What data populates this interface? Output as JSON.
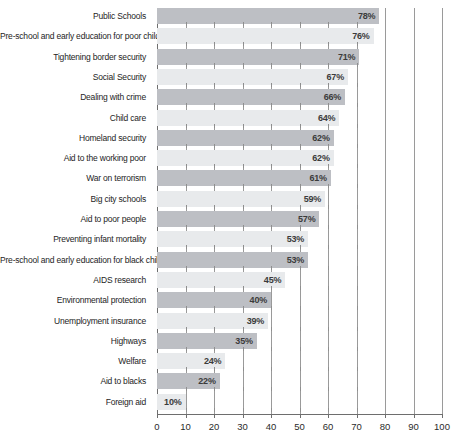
{
  "chart_data": {
    "type": "bar",
    "orientation": "horizontal",
    "title": "",
    "xlabel": "",
    "ylabel": "",
    "xlim": [
      0,
      100
    ],
    "xticks": [
      0,
      10,
      20,
      30,
      40,
      50,
      60,
      70,
      80,
      90,
      100
    ],
    "xtick_labels": [
      "0",
      "10",
      "20",
      "30",
      "40",
      "50",
      "60",
      "70",
      "80",
      "90",
      "100"
    ],
    "grid": "vertical",
    "legend": "none",
    "value_suffix": "%",
    "categories": [
      "Public Schools",
      "Pre-school and early education for poor children",
      "Tightening border security",
      "Social Security",
      "Dealing with crime",
      "Child care",
      "Homeland security",
      "Aid to the working poor",
      "War on terrorism",
      "Big city schools",
      "Aid to poor people",
      "Preventing infant mortality",
      "Pre-school and early education for black children",
      "AIDS research",
      "Environmental protection",
      "Unemployment insurance",
      "Highways",
      "Welfare",
      "Aid to blacks",
      "Foreign aid"
    ],
    "values": [
      78,
      76,
      71,
      67,
      66,
      64,
      62,
      62,
      61,
      59,
      57,
      53,
      53,
      45,
      40,
      39,
      35,
      24,
      22,
      10
    ],
    "value_labels": [
      "78%",
      "76%",
      "71%",
      "67%",
      "66%",
      "64%",
      "62%",
      "62%",
      "61%",
      "59%",
      "57%",
      "53%",
      "53%",
      "45%",
      "40%",
      "39%",
      "35%",
      "24%",
      "22%",
      "10%"
    ],
    "colors": {
      "bar_dark": "#bdbfc4",
      "bar_light": "#e8eaec",
      "axis": "#6e6e6e",
      "grid": "#9a9a9a",
      "text": "#242424"
    }
  }
}
